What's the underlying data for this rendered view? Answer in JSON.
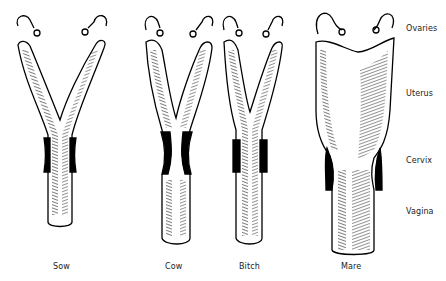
{
  "figure": {
    "species": [
      {
        "label": "Sow",
        "x": 60
      },
      {
        "label": "Cow",
        "x": 172
      },
      {
        "label": "Bitch",
        "x": 249
      },
      {
        "label": "Mare",
        "x": 351
      }
    ],
    "regions": [
      {
        "label": "Ovaries",
        "y": 29
      },
      {
        "label": "Uterus",
        "y": 94
      },
      {
        "label": "Cervix",
        "y": 161
      },
      {
        "label": "Vagina",
        "y": 212
      }
    ]
  }
}
